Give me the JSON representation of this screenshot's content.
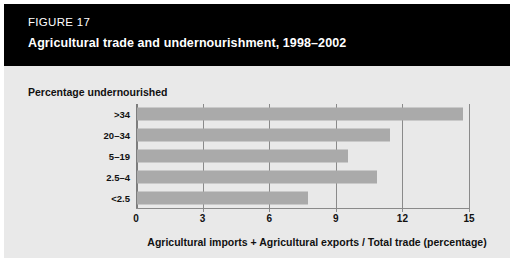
{
  "figure": {
    "number_label": "FIGURE 17",
    "title": "Agricultural trade and undernourishment, 1998–2002"
  },
  "colors": {
    "header_background": "#000000",
    "header_text": "#ffffff",
    "panel_background": "#e9e9e9",
    "bar_fill": "#aaaaaa",
    "axis": "#8a8a8a",
    "text": "#111111"
  },
  "chart_data": {
    "type": "bar",
    "orientation": "horizontal",
    "title": "Agricultural trade and undernourishment, 1998–2002",
    "subtitle": "FIGURE 17",
    "ylabel": "Percentage undernourished",
    "xlabel": "Agricultural imports + Agricultural exports  / Total trade (percentage)",
    "categories": [
      ">34",
      "20–34",
      "5–19",
      "2.5–4",
      "<2.5"
    ],
    "values": [
      14.7,
      11.4,
      9.5,
      10.8,
      7.7
    ],
    "xlim": [
      0,
      15.2
    ],
    "xticks": [
      0,
      3,
      6,
      9,
      12,
      15
    ],
    "xtick_labels": [
      "0",
      "3",
      "6",
      "9",
      "12",
      "15"
    ],
    "grid": "vertical",
    "legend": null,
    "series": [
      {
        "name": "Agricultural trade share of total trade",
        "values": [
          14.7,
          11.4,
          9.5,
          10.8,
          7.7
        ]
      }
    ]
  }
}
